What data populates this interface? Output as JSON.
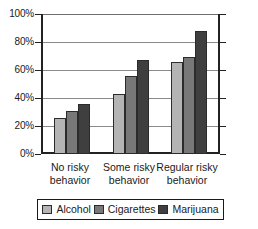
{
  "chart_data": {
    "type": "bar",
    "title": "",
    "xlabel": "",
    "ylabel": "",
    "ylim": [
      0,
      100
    ],
    "yticks": [
      0,
      20,
      40,
      60,
      80,
      100
    ],
    "ytick_labels": [
      "0%",
      "20%",
      "40%",
      "60%",
      "80%",
      "100%"
    ],
    "grid": true,
    "legend_position": "bottom",
    "categories": [
      "No risky behavior",
      "Some risky behavior",
      "Regular risky behavior"
    ],
    "category_lines": [
      [
        "No risky",
        "behavior"
      ],
      [
        "Some risky",
        "behavior"
      ],
      [
        "Regular risky",
        "behavior"
      ]
    ],
    "series": [
      {
        "name": "Alcohol",
        "color": "#b4b4b4",
        "values": [
          26,
          43,
          66
        ]
      },
      {
        "name": "Cigarettes",
        "color": "#787878",
        "values": [
          31,
          56,
          69
        ]
      },
      {
        "name": "Marijuana",
        "color": "#3f3f3f",
        "values": [
          36,
          67,
          88
        ]
      }
    ]
  },
  "legend": {
    "entries": [
      {
        "label": "Alcohol"
      },
      {
        "label": "Cigarettes"
      },
      {
        "label": "Marijuana"
      }
    ]
  },
  "axis": {
    "ytick_labels": [
      "100%",
      "80%",
      "60%",
      "40%",
      "20%",
      "0%"
    ]
  }
}
